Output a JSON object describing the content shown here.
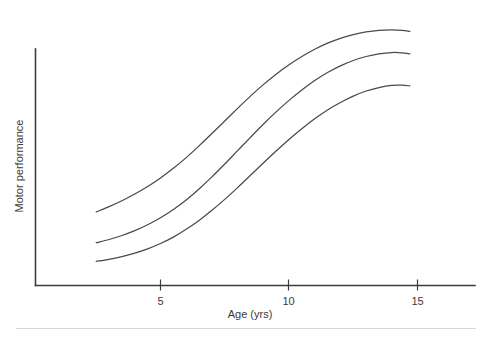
{
  "chart_data": {
    "type": "line",
    "title": "",
    "subtitle": "",
    "xlabel": "Age (yrs)",
    "ylabel": "Motor performance",
    "xlim": [
      1.2,
      17.5
    ],
    "ylim": [
      0,
      100
    ],
    "grid": false,
    "legend": null,
    "legend_position": "none",
    "xticks": [
      5,
      10,
      15
    ],
    "xtick_labels": [
      "5",
      "10",
      "15"
    ],
    "yticks": [],
    "ytick_labels": [],
    "annotations": [],
    "x": [
      2.5,
      3.0,
      3.5,
      4.0,
      4.5,
      5.0,
      5.5,
      6.0,
      6.5,
      7.0,
      7.5,
      8.0,
      8.5,
      9.0,
      9.5,
      10.0,
      10.5,
      11.0,
      11.5,
      12.0,
      12.5,
      13.0,
      13.5,
      14.0,
      14.4,
      14.7
    ],
    "series": [
      {
        "name": "curve-upper",
        "values": [
          27.5,
          29.5,
          31.7,
          34.2,
          37.0,
          40.2,
          43.8,
          47.8,
          52.2,
          56.8,
          61.5,
          66.2,
          70.8,
          75.1,
          79.0,
          82.5,
          85.6,
          88.3,
          90.6,
          92.4,
          93.8,
          94.8,
          95.4,
          95.6,
          95.4,
          95.0
        ]
      },
      {
        "name": "curve-middle",
        "values": [
          16.0,
          17.2,
          18.7,
          20.5,
          22.7,
          25.3,
          28.4,
          32.0,
          36.1,
          40.6,
          45.4,
          50.4,
          55.4,
          60.3,
          64.9,
          69.2,
          73.1,
          76.6,
          79.6,
          82.1,
          84.1,
          85.6,
          86.6,
          87.1,
          87.0,
          86.6
        ]
      },
      {
        "name": "curve-lower",
        "values": [
          9.0,
          9.8,
          10.8,
          12.1,
          13.7,
          15.7,
          18.1,
          21.0,
          24.3,
          28.1,
          32.2,
          36.6,
          41.2,
          45.8,
          50.3,
          54.6,
          58.6,
          62.3,
          65.6,
          68.4,
          70.8,
          72.7,
          74.0,
          74.8,
          74.9,
          74.6
        ]
      }
    ]
  },
  "figure": {
    "axis_title_x": "Age (yrs)",
    "axis_title_y": "Motor performance",
    "xtick_labels": [
      "5",
      "10",
      "15"
    ],
    "line_color": "#4a4a4a",
    "axis_color": "#3c3c3c",
    "background_color": "#ffffff",
    "footer_rule_color": "#d6d6d6"
  }
}
